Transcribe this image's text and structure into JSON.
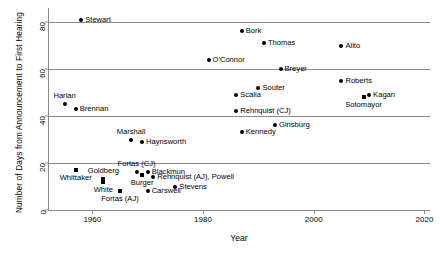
{
  "chart_data": {
    "type": "scatter",
    "title": "",
    "xlabel": "Year",
    "ylabel": "Number of Days from Announcement to First Hearing",
    "xlim": [
      1952,
      2021
    ],
    "ylim": [
      0,
      86
    ],
    "xticks": [
      1960,
      1980,
      2000,
      2020
    ],
    "yticks": [
      0,
      20,
      40,
      60,
      80
    ],
    "grid": "horizontal",
    "legend": "none",
    "points": [
      {
        "name": "Stewart",
        "year": 1958,
        "days": 81,
        "marker": "circle",
        "label_pos": "right"
      },
      {
        "name": "Bork",
        "year": 1987,
        "days": 76,
        "marker": "circle",
        "label_pos": "right"
      },
      {
        "name": "Thomas",
        "year": 1991,
        "days": 71,
        "marker": "circle",
        "label_pos": "right"
      },
      {
        "name": "Alito",
        "year": 2005,
        "days": 70,
        "marker": "circle",
        "label_pos": "right"
      },
      {
        "name": "O'Connor",
        "year": 1981,
        "days": 64,
        "marker": "circle",
        "label_pos": "right"
      },
      {
        "name": "Breyer",
        "year": 1994,
        "days": 60,
        "marker": "circle",
        "label_pos": "right"
      },
      {
        "name": "Roberts",
        "year": 2005,
        "days": 55,
        "marker": "circle",
        "label_pos": "right"
      },
      {
        "name": "Souter",
        "year": 1990,
        "days": 52,
        "marker": "circle",
        "label_pos": "right"
      },
      {
        "name": "Scalia",
        "year": 1986,
        "days": 49,
        "marker": "circle",
        "label_pos": "right"
      },
      {
        "name": "Kagan",
        "year": 2010,
        "days": 49,
        "marker": "circle",
        "label_pos": "right"
      },
      {
        "name": "Sotomayor",
        "year": 2009,
        "days": 48,
        "marker": "square",
        "label_pos": "below"
      },
      {
        "name": "Harlan",
        "year": 1955,
        "days": 45,
        "marker": "circle",
        "label_pos": "above"
      },
      {
        "name": "Brennan",
        "year": 1957,
        "days": 43,
        "marker": "circle",
        "label_pos": "right"
      },
      {
        "name": "Rehnquist (CJ)",
        "year": 1986,
        "days": 42,
        "marker": "circle",
        "label_pos": "right"
      },
      {
        "name": "Ginsburg",
        "year": 1993,
        "days": 36,
        "marker": "circle",
        "label_pos": "right"
      },
      {
        "name": "Kennedy",
        "year": 1987,
        "days": 33,
        "marker": "circle",
        "label_pos": "right"
      },
      {
        "name": "Marshall",
        "year": 1967,
        "days": 30,
        "marker": "circle",
        "label_pos": "above"
      },
      {
        "name": "Haynsworth",
        "year": 1969,
        "days": 29,
        "marker": "circle",
        "label_pos": "right"
      },
      {
        "name": "Whittaker",
        "year": 1957,
        "days": 17,
        "marker": "square",
        "label_pos": "below"
      },
      {
        "name": "Fortas (CJ)",
        "year": 1968,
        "days": 16,
        "marker": "circle",
        "label_pos": "above"
      },
      {
        "name": "Blackmun",
        "year": 1970,
        "days": 16,
        "marker": "circle",
        "label_pos": "right"
      },
      {
        "name": "Rehnquist (AJ), Powell",
        "year": 1971,
        "days": 14,
        "marker": "circle",
        "label_pos": "right"
      },
      {
        "name": "Goldberg",
        "year": 1962,
        "days": 13,
        "marker": "square",
        "label_pos": "above"
      },
      {
        "name": "White",
        "year": 1962,
        "days": 12,
        "marker": "square",
        "label_pos": "below"
      },
      {
        "name": "Burger",
        "year": 1969,
        "days": 15,
        "marker": "square",
        "label_pos": "below"
      },
      {
        "name": "Stevens",
        "year": 1975,
        "days": 10,
        "marker": "circle",
        "label_pos": "right"
      },
      {
        "name": "Carswell",
        "year": 1970,
        "days": 8,
        "marker": "circle",
        "label_pos": "right"
      },
      {
        "name": "Fortas (AJ)",
        "year": 1965,
        "days": 8,
        "marker": "square",
        "label_pos": "below"
      }
    ]
  },
  "axes": {
    "xtick_labels": [
      "1960",
      "1980",
      "2000",
      "2020"
    ],
    "ytick_labels": [
      "0",
      "20",
      "40",
      "60",
      "80"
    ],
    "x_title": "Year",
    "y_title": "Number of Days from Announcement to First Hearing"
  },
  "colors": {
    "marker": "#000000",
    "axis": "#8a8a8a",
    "grid": "#8a8a8a",
    "background": "#ffffff",
    "text": "#000000"
  }
}
